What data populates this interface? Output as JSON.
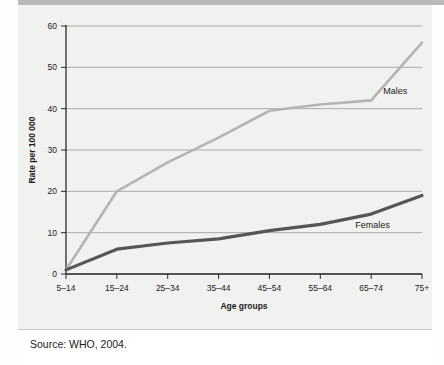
{
  "figure": {
    "source_note": "Source: WHO, 2004."
  },
  "chart_data": {
    "type": "line",
    "title": "",
    "xlabel": "Age groups",
    "ylabel": "Rate per 100 000",
    "categories": [
      "5–14",
      "15–24",
      "25–34",
      "35–44",
      "45–54",
      "55–64",
      "65–74",
      "75+"
    ],
    "yticks": [
      0,
      10,
      20,
      30,
      40,
      50,
      60
    ],
    "ylim": [
      0,
      60
    ],
    "grid": true,
    "legend": "inline-annotations",
    "series": [
      {
        "name": "Males",
        "color": "#b4b4b4",
        "values": [
          1,
          20,
          27,
          33,
          39.5,
          41,
          42,
          56
        ]
      },
      {
        "name": "Females",
        "color": "#565656",
        "values": [
          1,
          6,
          7.5,
          8.5,
          10.5,
          12,
          14.5,
          19
        ]
      }
    ],
    "annotations": [
      {
        "text": "Males",
        "series": "Males"
      },
      {
        "text": "Females",
        "series": "Females"
      }
    ]
  }
}
